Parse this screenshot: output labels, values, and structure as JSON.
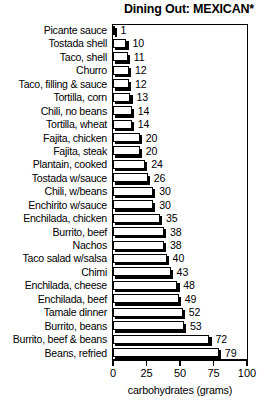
{
  "chart_data": {
    "type": "bar",
    "orientation": "horizontal",
    "title": "Dining Out: MEXICAN*",
    "xlabel": "carbohydrates (grams)",
    "ylabel": "",
    "xlim": [
      0,
      100
    ],
    "xticks": [
      0,
      25,
      50,
      75,
      100
    ],
    "xtick_labels": [
      "0",
      "25",
      "50",
      "75",
      "100"
    ],
    "grid": false,
    "legend": null,
    "categories": [
      "Picante sauce",
      "Tostada shell",
      "Taco, shell",
      "Churro",
      "Taco, filling & sauce",
      "Tortilla, corn",
      "Chili, no beans",
      "Tortilla, wheat",
      "Fajita, chicken",
      "Fajita, steak",
      "Plantain, cooked",
      "Tostada w/sauce",
      "Chili, w/beans",
      "Enchirito w/sauce",
      "Enchilada, chicken",
      "Burrito, beef",
      "Nachos",
      "Taco salad w/salsa",
      "Chimi",
      "Enchilada, cheese",
      "Enchilada, beef",
      "Tamale dinner",
      "Burrito, beans",
      "Burrito, beef & beans",
      "Beans, refried"
    ],
    "values": [
      1,
      10,
      11,
      12,
      12,
      13,
      14,
      14,
      20,
      20,
      24,
      26,
      30,
      30,
      35,
      38,
      38,
      40,
      43,
      48,
      49,
      52,
      53,
      72,
      79
    ],
    "value_labels": [
      "1",
      "10",
      "11",
      "12",
      "12",
      "13",
      "14",
      "14",
      "20",
      "20",
      "24",
      "26",
      "30",
      "30",
      "35",
      "38",
      "38",
      "40",
      "43",
      "48",
      "49",
      "52",
      "53",
      "72",
      "79"
    ],
    "bar_fill_color": "#ffffff",
    "bar_edge_color": "#000000",
    "bar_shadow_color": "#000000",
    "background_color": "#ffffff"
  }
}
